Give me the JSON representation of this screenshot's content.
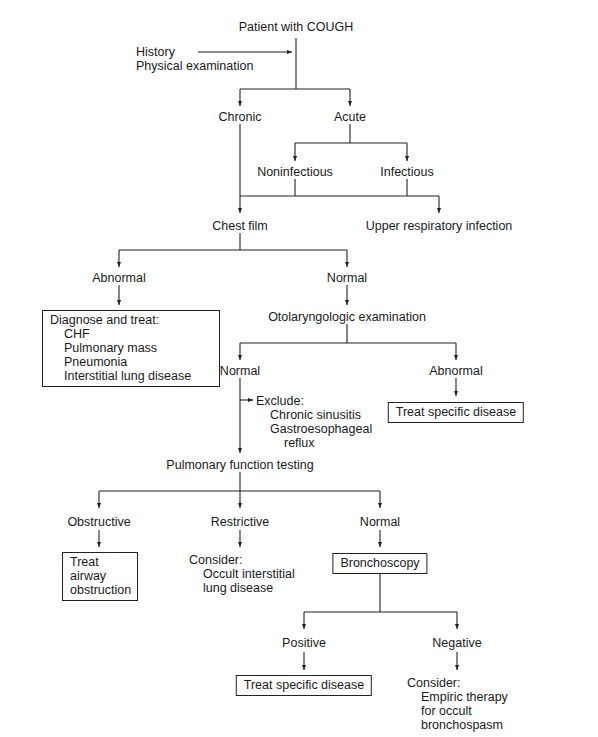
{
  "diagram": {
    "title": "Patient with COUGH",
    "side_inputs": [
      "History",
      "Physical examination"
    ],
    "level1": {
      "chronic": "Chronic",
      "acute": "Acute"
    },
    "acute_branch": {
      "noninfectious": "Noninfectious",
      "infectious": "Infectious"
    },
    "level2": {
      "chest_film": "Chest film",
      "uri": "Upper respiratory infection"
    },
    "chest_film_branch": {
      "abnormal": "Abnormal",
      "normal": "Normal"
    },
    "diagnose_box": {
      "heading": "Diagnose and treat:",
      "items": [
        "CHF",
        "Pulmonary mass",
        "Pneumonia",
        "Interstitial lung disease"
      ]
    },
    "oto_exam": "Otolaryngologic examination",
    "oto_branch": {
      "normal": "Normal",
      "abnormal": "Abnormal"
    },
    "oto_abnormal_box": "Treat specific disease",
    "exclude": {
      "heading": "Exclude:",
      "items": [
        "Chronic sinusitis",
        "Gastroesophageal",
        "reflux"
      ]
    },
    "pft": "Pulmonary function testing",
    "pft_branch": {
      "obstructive": "Obstructive",
      "restrictive": "Restrictive",
      "normal": "Normal"
    },
    "obstructive_box": [
      "Treat",
      "airway",
      "obstruction"
    ],
    "restrictive_consider": {
      "heading": "Consider:",
      "items": [
        "Occult interstitial",
        "lung disease"
      ]
    },
    "bronchoscopy_box": "Bronchoscopy",
    "bronch_branch": {
      "positive": "Positive",
      "negative": "Negative"
    },
    "positive_box": "Treat specific disease",
    "negative_consider": {
      "heading": "Consider:",
      "items": [
        "Empiric therapy",
        "for occult",
        "bronchospasm"
      ]
    }
  },
  "colors": {
    "line": "#222222",
    "text": "#1a1a1a",
    "background": "#ffffff"
  }
}
